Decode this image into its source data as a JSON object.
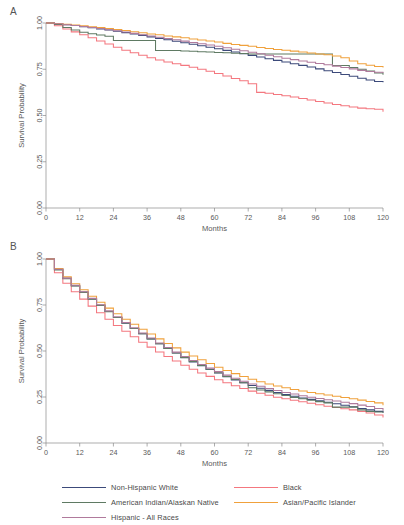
{
  "figure": {
    "panels": [
      {
        "letter": "A"
      },
      {
        "letter": "B"
      }
    ],
    "axis": {
      "xlabel": "Months",
      "ylabel": "Survival Probability",
      "xticks": [
        "0",
        "12",
        "24",
        "36",
        "48",
        "60",
        "72",
        "84",
        "96",
        "108",
        "120"
      ],
      "yticks": [
        "0.00",
        "0.25",
        "0.50",
        "0.75",
        "1.00"
      ]
    }
  },
  "legend": {
    "items": [
      {
        "label": "Non-Hispanic White",
        "color": "#3c4a7a"
      },
      {
        "label": "Black",
        "color": "#f4777f"
      },
      {
        "label": "American Indian/Alaskan Native",
        "color": "#5f7a63"
      },
      {
        "label": "Asian/Pacific Islander",
        "color": "#f0a13c"
      },
      {
        "label": "Hispanic - All Races",
        "color": "#b07a9c"
      }
    ]
  },
  "chart_data": [
    {
      "type": "line",
      "panel": "A",
      "title": "",
      "xlabel": "Months",
      "ylabel": "Survival Probability",
      "xlim": [
        0,
        120
      ],
      "ylim": [
        0,
        1
      ],
      "xticks": [
        0,
        12,
        24,
        36,
        48,
        60,
        72,
        84,
        96,
        108,
        120
      ],
      "yticks": [
        0.0,
        0.25,
        0.5,
        0.75,
        1.0
      ],
      "grid": false,
      "legend_position": "below-figure",
      "x": [
        0,
        3,
        6,
        9,
        12,
        15,
        18,
        21,
        24,
        27,
        30,
        33,
        36,
        39,
        42,
        45,
        48,
        51,
        54,
        57,
        60,
        63,
        66,
        69,
        72,
        75,
        78,
        81,
        84,
        87,
        90,
        93,
        96,
        99,
        102,
        105,
        108,
        111,
        114,
        117,
        120
      ],
      "series": [
        {
          "name": "Non-Hispanic White",
          "color": "#3c4a7a",
          "values": [
            1.0,
            0.996,
            0.991,
            0.986,
            0.98,
            0.974,
            0.968,
            0.962,
            0.955,
            0.948,
            0.941,
            0.933,
            0.925,
            0.917,
            0.909,
            0.901,
            0.893,
            0.885,
            0.877,
            0.869,
            0.861,
            0.852,
            0.843,
            0.834,
            0.825,
            0.816,
            0.807,
            0.798,
            0.789,
            0.78,
            0.771,
            0.762,
            0.752,
            0.742,
            0.732,
            0.722,
            0.712,
            0.701,
            0.692,
            0.684,
            0.68
          ]
        },
        {
          "name": "Black",
          "color": "#f4777f",
          "values": [
            1.0,
            0.985,
            0.968,
            0.952,
            0.936,
            0.92,
            0.903,
            0.886,
            0.869,
            0.853,
            0.839,
            0.826,
            0.812,
            0.8,
            0.789,
            0.78,
            0.771,
            0.761,
            0.75,
            0.739,
            0.727,
            0.713,
            0.7,
            0.688,
            0.672,
            0.625,
            0.62,
            0.614,
            0.607,
            0.6,
            0.592,
            0.584,
            0.576,
            0.568,
            0.56,
            0.553,
            0.546,
            0.54,
            0.536,
            0.534,
            0.52
          ]
        },
        {
          "name": "American Indian/Alaskan Native",
          "color": "#5f7a63",
          "values": [
            1.0,
            0.992,
            0.976,
            0.962,
            0.95,
            0.942,
            0.935,
            0.928,
            0.905,
            0.905,
            0.905,
            0.905,
            0.905,
            0.851,
            0.851,
            0.851,
            0.849,
            0.847,
            0.845,
            0.843,
            0.841,
            0.839,
            0.837,
            0.835,
            0.833,
            0.833,
            0.833,
            0.833,
            0.833,
            0.833,
            0.833,
            0.833,
            0.833,
            0.833,
            0.77,
            0.77,
            0.76,
            0.75,
            0.74,
            0.73,
            0.72
          ]
        },
        {
          "name": "Asian/Pacific Islander",
          "color": "#f0a13c",
          "values": [
            1.0,
            0.997,
            0.993,
            0.989,
            0.985,
            0.98,
            0.975,
            0.97,
            0.965,
            0.959,
            0.953,
            0.947,
            0.941,
            0.936,
            0.93,
            0.925,
            0.92,
            0.914,
            0.908,
            0.903,
            0.897,
            0.89,
            0.884,
            0.879,
            0.874,
            0.868,
            0.862,
            0.857,
            0.853,
            0.848,
            0.843,
            0.838,
            0.833,
            0.828,
            0.822,
            0.812,
            0.795,
            0.78,
            0.772,
            0.765,
            0.76
          ]
        },
        {
          "name": "Hispanic - All Races",
          "color": "#b07a9c",
          "values": [
            1.0,
            0.996,
            0.991,
            0.986,
            0.981,
            0.976,
            0.97,
            0.964,
            0.958,
            0.951,
            0.944,
            0.937,
            0.93,
            0.923,
            0.916,
            0.909,
            0.902,
            0.895,
            0.888,
            0.881,
            0.874,
            0.866,
            0.858,
            0.85,
            0.842,
            0.834,
            0.826,
            0.818,
            0.81,
            0.802,
            0.795,
            0.788,
            0.781,
            0.774,
            0.767,
            0.76,
            0.752,
            0.744,
            0.738,
            0.734,
            0.73
          ]
        }
      ]
    },
    {
      "type": "line",
      "panel": "B",
      "title": "",
      "xlabel": "Months",
      "ylabel": "Survival Probability",
      "xlim": [
        0,
        120
      ],
      "ylim": [
        0,
        1
      ],
      "xticks": [
        0,
        12,
        24,
        36,
        48,
        60,
        72,
        84,
        96,
        108,
        120
      ],
      "yticks": [
        0.0,
        0.25,
        0.5,
        0.75,
        1.0
      ],
      "grid": false,
      "legend_position": "below-figure",
      "x": [
        0,
        3,
        6,
        9,
        12,
        15,
        18,
        21,
        24,
        27,
        30,
        33,
        36,
        39,
        42,
        45,
        48,
        51,
        54,
        57,
        60,
        63,
        66,
        69,
        72,
        75,
        78,
        81,
        84,
        87,
        90,
        93,
        96,
        99,
        102,
        105,
        108,
        111,
        114,
        117,
        120
      ],
      "series": [
        {
          "name": "Non-Hispanic White",
          "color": "#3c4a7a",
          "values": [
            1.0,
            0.945,
            0.895,
            0.855,
            0.82,
            0.783,
            0.748,
            0.715,
            0.682,
            0.651,
            0.622,
            0.594,
            0.566,
            0.539,
            0.514,
            0.489,
            0.464,
            0.441,
            0.42,
            0.4,
            0.38,
            0.36,
            0.343,
            0.327,
            0.312,
            0.298,
            0.286,
            0.275,
            0.264,
            0.254,
            0.245,
            0.237,
            0.229,
            0.221,
            0.213,
            0.205,
            0.197,
            0.188,
            0.18,
            0.172,
            0.165
          ]
        },
        {
          "name": "Black",
          "color": "#f4777f",
          "values": [
            1.0,
            0.925,
            0.868,
            0.822,
            0.782,
            0.744,
            0.708,
            0.673,
            0.639,
            0.607,
            0.577,
            0.548,
            0.521,
            0.495,
            0.47,
            0.446,
            0.423,
            0.401,
            0.381,
            0.362,
            0.344,
            0.327,
            0.311,
            0.296,
            0.282,
            0.27,
            0.259,
            0.249,
            0.24,
            0.232,
            0.224,
            0.216,
            0.208,
            0.2,
            0.193,
            0.186,
            0.18,
            0.172,
            0.163,
            0.152,
            0.138
          ]
        },
        {
          "name": "American Indian/Alaskan Native",
          "color": "#5f7a63",
          "values": [
            1.0,
            0.94,
            0.893,
            0.853,
            0.818,
            0.782,
            0.748,
            0.714,
            0.682,
            0.652,
            0.622,
            0.594,
            0.566,
            0.54,
            0.514,
            0.489,
            0.465,
            0.443,
            0.421,
            0.401,
            0.382,
            0.362,
            0.345,
            0.328,
            0.3,
            0.288,
            0.278,
            0.268,
            0.258,
            0.248,
            0.24,
            0.232,
            0.225,
            0.218,
            0.195,
            0.195,
            0.195,
            0.18,
            0.172,
            0.168,
            0.165
          ]
        },
        {
          "name": "Asian/Pacific Islander",
          "color": "#f0a13c",
          "values": [
            1.0,
            0.948,
            0.903,
            0.866,
            0.833,
            0.798,
            0.765,
            0.733,
            0.702,
            0.673,
            0.645,
            0.618,
            0.592,
            0.566,
            0.541,
            0.517,
            0.494,
            0.473,
            0.452,
            0.432,
            0.412,
            0.394,
            0.377,
            0.361,
            0.346,
            0.333,
            0.321,
            0.31,
            0.3,
            0.291,
            0.283,
            0.275,
            0.268,
            0.261,
            0.254,
            0.247,
            0.241,
            0.233,
            0.226,
            0.218,
            0.205
          ]
        },
        {
          "name": "Hispanic - All Races",
          "color": "#b07a9c",
          "values": [
            1.0,
            0.944,
            0.896,
            0.857,
            0.822,
            0.786,
            0.751,
            0.718,
            0.686,
            0.655,
            0.626,
            0.598,
            0.571,
            0.544,
            0.519,
            0.494,
            0.47,
            0.448,
            0.427,
            0.407,
            0.388,
            0.369,
            0.352,
            0.336,
            0.321,
            0.308,
            0.296,
            0.285,
            0.275,
            0.266,
            0.257,
            0.249,
            0.242,
            0.235,
            0.228,
            0.221,
            0.214,
            0.206,
            0.198,
            0.188,
            0.175
          ]
        }
      ]
    }
  ]
}
